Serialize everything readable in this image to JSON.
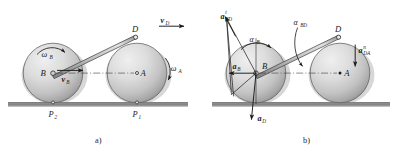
{
  "figure": {
    "background_color": "#ffffff",
    "ink_color": "#1a1a1a",
    "ground_color": "#8f8f8f",
    "disk_fill_light": "#e8e8e8",
    "disk_fill_dark": "#9a9a9a",
    "link_fill": "#b8b8b8"
  },
  "panel_a": {
    "caption": "a)",
    "points": {
      "B": "B",
      "A": "A",
      "D": "D",
      "P1": "P",
      "P1_sub": "1",
      "P2": "P",
      "P2_sub": "2"
    },
    "vectors": [
      {
        "name": "v-D",
        "base": "v",
        "sub": "D",
        "direction": "right",
        "description": "velocity of point D, horizontal to the right"
      },
      {
        "name": "v-B",
        "base": "v",
        "sub": "B",
        "direction": "right",
        "description": "velocity of point B, horizontal to the right"
      }
    ],
    "angular": [
      {
        "name": "omega-B",
        "base": "ω",
        "sub": "B",
        "sense": "counterclockwise",
        "description": "angular velocity of left disk"
      },
      {
        "name": "omega-A",
        "base": "ω",
        "sub": "A",
        "sense": "clockwise",
        "description": "angular velocity of right disk"
      }
    ]
  },
  "panel_b": {
    "caption": "b)",
    "points": {
      "B": "B",
      "A": "A",
      "D": "D"
    },
    "vectors": [
      {
        "name": "a-BD-tangential",
        "base": "a",
        "sub": "BD",
        "sup": "t",
        "description": "tangential acceleration component of B relative to D"
      },
      {
        "name": "a-B",
        "base": "a",
        "sub": "B",
        "description": "acceleration of point B"
      },
      {
        "name": "a-D",
        "base": "a",
        "sub": "D",
        "description": "acceleration of point D, directed downward"
      },
      {
        "name": "a-DA-normal",
        "base": "a",
        "sub": "DA",
        "sup": "n",
        "description": "normal acceleration of D relative to A"
      }
    ],
    "angular": [
      {
        "name": "alpha-B",
        "base": "α",
        "sub": "B",
        "sense": "counterclockwise",
        "description": "angular acceleration of left disk"
      },
      {
        "name": "alpha-BD",
        "base": "α",
        "sub": "BD",
        "sense": "pointer",
        "description": "angular acceleration of link BD"
      }
    ]
  }
}
